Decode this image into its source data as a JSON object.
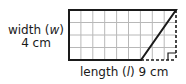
{
  "figure": {
    "type": "parallelogram-on-grid",
    "grid": {
      "columns": 9,
      "rows": 4
    },
    "width_label": {
      "prefix": "width (",
      "var": "w",
      "suffix": ")",
      "value": "4 cm"
    },
    "length_label": {
      "prefix": "length (",
      "var": "l",
      "suffix": ")",
      "value": "9 cm"
    },
    "colors": {
      "outline": "#1a1a1a",
      "grid": "#b8b8b8",
      "dashed": "#1a1a1a"
    }
  }
}
